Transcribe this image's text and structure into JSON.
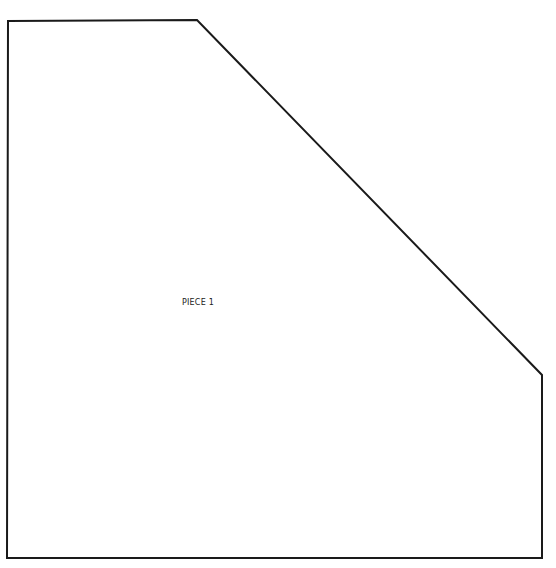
{
  "pattern": {
    "piece": {
      "label": "PIECE 1",
      "outline_points": [
        [
          8,
          21
        ],
        [
          197,
          20
        ],
        [
          542,
          375
        ],
        [
          542,
          558
        ],
        [
          7,
          558
        ]
      ],
      "stroke_color": "#1a1a1a",
      "fill_color": "#ffffff",
      "stroke_width": 2
    }
  }
}
